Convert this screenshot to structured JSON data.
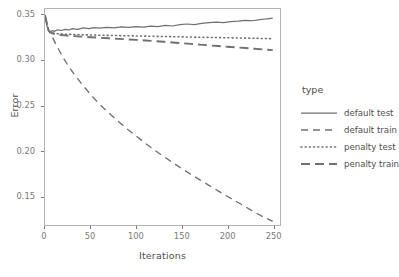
{
  "chart_data": {
    "type": "line",
    "title": "",
    "xlabel": "Iterations",
    "ylabel": "Error",
    "xlim": [
      0,
      258
    ],
    "ylim": [
      0.118,
      0.357
    ],
    "grid": false,
    "legend_position": "right",
    "legend_title": "type",
    "xticks": [
      0,
      50,
      100,
      150,
      200,
      250
    ],
    "xtick_labels": [
      "0",
      "50",
      "100",
      "150",
      "200",
      "250"
    ],
    "yticks": [
      0.15,
      0.2,
      0.25,
      0.3,
      0.35
    ],
    "ytick_labels": [
      "0.15",
      "0.20",
      "0.25",
      "0.30",
      "0.35"
    ],
    "line_color": "#707070",
    "panel_border_color": "#b4b4b4",
    "series": [
      {
        "name": "default test",
        "style": "solid",
        "x": [
          0,
          2,
          4,
          6,
          8,
          10,
          14,
          18,
          22,
          26,
          30,
          36,
          42,
          48,
          54,
          60,
          68,
          76,
          84,
          92,
          100,
          108,
          116,
          124,
          132,
          140,
          148,
          156,
          164,
          172,
          180,
          188,
          196,
          204,
          212,
          220,
          228,
          236,
          244,
          250
        ],
        "y": [
          0.35,
          0.3385,
          0.333,
          0.3318,
          0.333,
          0.3322,
          0.334,
          0.3332,
          0.3345,
          0.3338,
          0.3352,
          0.3345,
          0.336,
          0.3352,
          0.3364,
          0.3358,
          0.3368,
          0.3362,
          0.3372,
          0.3366,
          0.3376,
          0.337,
          0.338,
          0.3376,
          0.3388,
          0.3382,
          0.3396,
          0.3404,
          0.3398,
          0.3412,
          0.3418,
          0.3424,
          0.3418,
          0.343,
          0.3436,
          0.3444,
          0.344,
          0.3452,
          0.3462,
          0.3468
        ]
      },
      {
        "name": "default train",
        "style": "dashed",
        "x": [
          0,
          4,
          8,
          12,
          16,
          20,
          26,
          32,
          40,
          50,
          60,
          70,
          80,
          90,
          100,
          110,
          120,
          130,
          140,
          150,
          160,
          170,
          180,
          190,
          200,
          210,
          220,
          230,
          240,
          250
        ],
        "y": [
          0.35,
          0.333,
          0.326,
          0.318,
          0.3105,
          0.303,
          0.2935,
          0.285,
          0.2745,
          0.2625,
          0.2515,
          0.242,
          0.233,
          0.2245,
          0.2165,
          0.2085,
          0.201,
          0.194,
          0.1872,
          0.1805,
          0.1742,
          0.168,
          0.1618,
          0.1558,
          0.1498,
          0.144,
          0.1382,
          0.1322,
          0.1268,
          0.122
        ]
      },
      {
        "name": "penalty test",
        "style": "dotted",
        "x": [
          0,
          4,
          8,
          12,
          18,
          24,
          32,
          40,
          50,
          60,
          70,
          80,
          90,
          100,
          110,
          120,
          130,
          140,
          150,
          160,
          170,
          180,
          190,
          200,
          210,
          220,
          230,
          240,
          250
        ],
        "y": [
          0.35,
          0.3332,
          0.3306,
          0.3298,
          0.3294,
          0.329,
          0.3288,
          0.3285,
          0.3283,
          0.328,
          0.3278,
          0.3276,
          0.3274,
          0.3272,
          0.327,
          0.3268,
          0.3266,
          0.3264,
          0.3262,
          0.326,
          0.3258,
          0.3256,
          0.3254,
          0.3252,
          0.325,
          0.3248,
          0.3246,
          0.3244,
          0.3242
        ]
      },
      {
        "name": "penalty train",
        "style": "longdash",
        "x": [
          0,
          4,
          8,
          12,
          18,
          24,
          32,
          40,
          50,
          60,
          70,
          80,
          90,
          100,
          110,
          120,
          130,
          140,
          150,
          160,
          170,
          180,
          190,
          200,
          210,
          220,
          230,
          240,
          250
        ],
        "y": [
          0.35,
          0.333,
          0.33,
          0.329,
          0.3282,
          0.3276,
          0.327,
          0.3264,
          0.3258,
          0.3252,
          0.3246,
          0.324,
          0.3234,
          0.3228,
          0.3222,
          0.3215,
          0.3208,
          0.32,
          0.3192,
          0.3184,
          0.3176,
          0.3168,
          0.316,
          0.3152,
          0.3145,
          0.3138,
          0.313,
          0.3122,
          0.3115
        ]
      }
    ]
  }
}
